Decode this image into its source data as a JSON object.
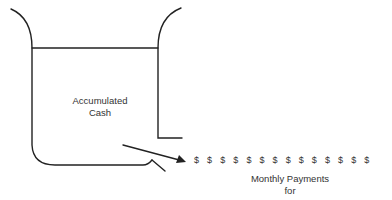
{
  "diagram": {
    "container_label_line1": "Accumulated",
    "container_label_line2": "Cash",
    "payments_label_line1": "Monthly Payments",
    "payments_label_line2": "for",
    "payment_symbol": "$",
    "payment_count": 14,
    "payments": [
      "$",
      "$",
      "$",
      "$",
      "$",
      "$",
      "$",
      "$",
      "$",
      "$",
      "$",
      "$",
      "$",
      "$"
    ],
    "stroke_color": "#222222"
  }
}
